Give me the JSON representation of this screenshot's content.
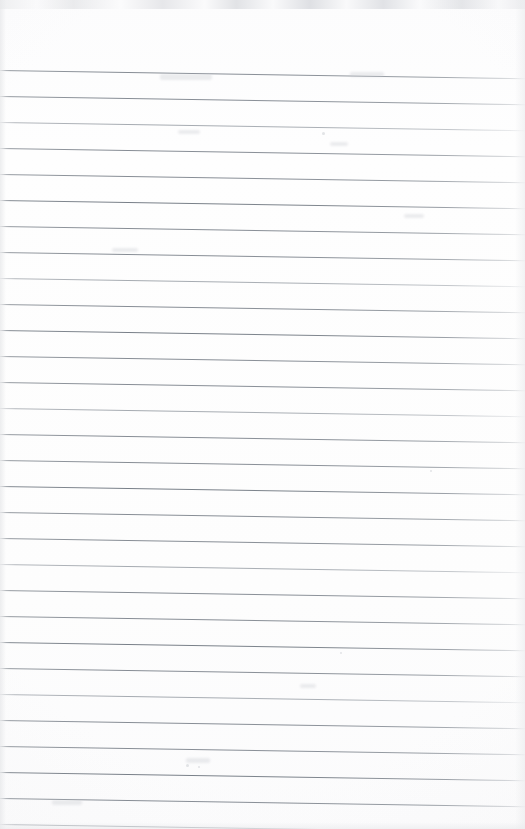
{
  "document": {
    "kind": "scanned-ruled-notebook-page",
    "title": "",
    "page_width": 525,
    "page_height": 829,
    "written_text": "",
    "header_text": "",
    "page_number": "",
    "body_text_lines": []
  },
  "paper": {
    "background_color": "#fdfdfd",
    "edge_shadow_color": "#e7e8ea",
    "top_noise_color": "#dcdde0"
  },
  "ruling": {
    "line_color": "#888e96",
    "line_color_heavy": "#777e87",
    "line_color_light": "#9ba0a8",
    "line_count": 30,
    "line_spacing_px": 26,
    "first_line_y_px": 70,
    "tilt_degrees": 0.9,
    "left_margin_rule": "none",
    "orientation": "horizontal",
    "lines": [
      {
        "index": 1,
        "y": 70,
        "weight": "normal"
      },
      {
        "index": 2,
        "y": 96,
        "weight": "normal"
      },
      {
        "index": 3,
        "y": 122,
        "weight": "light"
      },
      {
        "index": 4,
        "y": 148,
        "weight": "normal"
      },
      {
        "index": 5,
        "y": 174,
        "weight": "normal"
      },
      {
        "index": 6,
        "y": 200,
        "weight": "heavy"
      },
      {
        "index": 7,
        "y": 226,
        "weight": "normal"
      },
      {
        "index": 8,
        "y": 252,
        "weight": "normal"
      },
      {
        "index": 9,
        "y": 278,
        "weight": "light"
      },
      {
        "index": 10,
        "y": 304,
        "weight": "normal"
      },
      {
        "index": 11,
        "y": 330,
        "weight": "heavy"
      },
      {
        "index": 12,
        "y": 356,
        "weight": "normal"
      },
      {
        "index": 13,
        "y": 382,
        "weight": "normal"
      },
      {
        "index": 14,
        "y": 408,
        "weight": "light"
      },
      {
        "index": 15,
        "y": 434,
        "weight": "normal"
      },
      {
        "index": 16,
        "y": 460,
        "weight": "normal"
      },
      {
        "index": 17,
        "y": 486,
        "weight": "heavy"
      },
      {
        "index": 18,
        "y": 512,
        "weight": "normal"
      },
      {
        "index": 19,
        "y": 538,
        "weight": "normal"
      },
      {
        "index": 20,
        "y": 564,
        "weight": "light"
      },
      {
        "index": 21,
        "y": 590,
        "weight": "normal"
      },
      {
        "index": 22,
        "y": 616,
        "weight": "normal"
      },
      {
        "index": 23,
        "y": 642,
        "weight": "heavy"
      },
      {
        "index": 24,
        "y": 668,
        "weight": "normal"
      },
      {
        "index": 25,
        "y": 694,
        "weight": "light"
      },
      {
        "index": 26,
        "y": 720,
        "weight": "normal"
      },
      {
        "index": 27,
        "y": 746,
        "weight": "normal"
      },
      {
        "index": 28,
        "y": 772,
        "weight": "heavy"
      },
      {
        "index": 29,
        "y": 798,
        "weight": "normal"
      },
      {
        "index": 30,
        "y": 824,
        "weight": "light"
      }
    ]
  },
  "artifacts": {
    "ghost_marks": [
      {
        "x": 160,
        "y": 74,
        "w": 52,
        "h": 6
      },
      {
        "x": 350,
        "y": 72,
        "w": 34,
        "h": 5
      },
      {
        "x": 178,
        "y": 130,
        "w": 22,
        "h": 4
      },
      {
        "x": 330,
        "y": 142,
        "w": 18,
        "h": 4
      },
      {
        "x": 112,
        "y": 248,
        "w": 26,
        "h": 4
      },
      {
        "x": 404,
        "y": 214,
        "w": 20,
        "h": 4
      },
      {
        "x": 300,
        "y": 684,
        "w": 16,
        "h": 4
      },
      {
        "x": 186,
        "y": 758,
        "w": 24,
        "h": 5
      },
      {
        "x": 52,
        "y": 800,
        "w": 30,
        "h": 5
      }
    ],
    "specks": [
      {
        "x": 322,
        "y": 132,
        "d": 3
      },
      {
        "x": 186,
        "y": 764,
        "d": 3
      },
      {
        "x": 198,
        "y": 766,
        "d": 2
      },
      {
        "x": 340,
        "y": 652,
        "d": 2
      },
      {
        "x": 430,
        "y": 470,
        "d": 2
      }
    ]
  }
}
